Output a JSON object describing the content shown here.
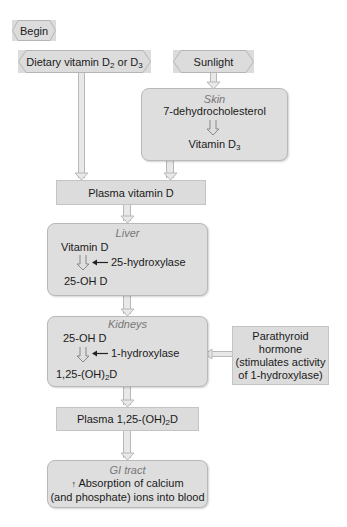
{
  "start": {
    "label": "Begin"
  },
  "sources": {
    "dietary": {
      "prefix": "Dietary vitamin D",
      "sub1": "2",
      "mid": " or D",
      "sub2": "3"
    },
    "sunlight": {
      "label": "Sunlight"
    }
  },
  "skin": {
    "organ": "Skin",
    "substrate": "7-dehydrocholesterol",
    "product_prefix": "Vitamin D",
    "product_sub": "3"
  },
  "plasma_d": {
    "label": "Plasma vitamin D"
  },
  "liver": {
    "organ": "Liver",
    "substrate": "Vitamin D",
    "enzyme": "25-hydroxylase",
    "product": "25-OH D"
  },
  "kidneys": {
    "organ": "Kidneys",
    "substrate": "25-OH D",
    "enzyme": "1-hydroxylase",
    "product_prefix": "1,25-(OH)",
    "product_sub": "2",
    "product_suffix": "D"
  },
  "pth": {
    "line1": "Parathyroid",
    "line2": "hormone",
    "line3": "(stimulates activity",
    "line4": "of 1-hydroxylase)"
  },
  "plasma_125": {
    "prefix": "Plasma 1,25-(OH)",
    "sub": "2",
    "suffix": "D"
  },
  "gi": {
    "organ": "GI tract",
    "arrow": "↑",
    "line1": " Absorption of calcium",
    "line2": "(and phosphate) ions into blood"
  },
  "colors": {
    "box_fill": "#dcdcdc",
    "border": "#b9b9b9",
    "organ_text": "#777777",
    "connector": "#e8e8e8"
  }
}
